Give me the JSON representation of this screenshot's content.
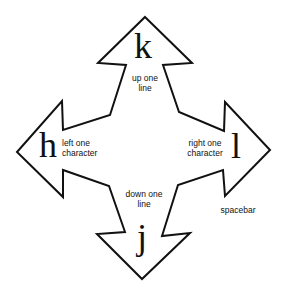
{
  "diagram": {
    "arrow_color": "#111111",
    "background": "#ffffff",
    "keys": {
      "up": {
        "letter": "k",
        "line1": "up one",
        "line2": "line"
      },
      "left": {
        "letter": "h",
        "line1": "left one",
        "line2": "character"
      },
      "right": {
        "letter": "l",
        "line1": "right one",
        "line2": "character",
        "extra": "spacebar"
      },
      "down": {
        "letter": "j",
        "line1": "down one",
        "line2": "line"
      }
    }
  }
}
